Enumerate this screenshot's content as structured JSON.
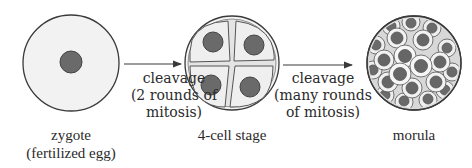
{
  "stages": [
    {
      "id": "zygote",
      "title": "zygote",
      "subtitle": "(fertilized egg)"
    },
    {
      "id": "four-cell",
      "title": "4-cell stage"
    },
    {
      "id": "morula",
      "title": "morula"
    }
  ],
  "arrows": [
    {
      "from": "zygote",
      "to": "four-cell",
      "lines": [
        "cleavage",
        "(2 rounds of",
        "mitosis)"
      ]
    },
    {
      "from": "four-cell",
      "to": "morula",
      "lines": [
        "cleavage",
        "(many rounds",
        "of mitosis)"
      ]
    }
  ],
  "colors": {
    "outline": "#3a3a3a",
    "cytoplasm": "#f1f1f1",
    "nucleus": "#6a6a6a",
    "cell_fill": "#ececec",
    "zona": "#d9d9d9"
  }
}
